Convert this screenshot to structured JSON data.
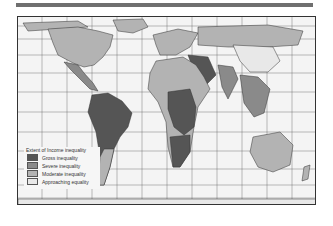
{
  "figure": {
    "top_rule_color": "#6f6f6f",
    "map": {
      "type": "world choropleth (Peters-style projection)",
      "graticule": true
    },
    "legend": {
      "title": "Extent of Income inequality",
      "items": [
        {
          "label": "Gross inequality",
          "color": "#555555"
        },
        {
          "label": "Severe inequality",
          "color": "#8a8a8a"
        },
        {
          "label": "Moderate inequality",
          "color": "#b3b3b3"
        },
        {
          "label": "Approaching equality",
          "color": "#e8e8e8"
        }
      ]
    }
  }
}
